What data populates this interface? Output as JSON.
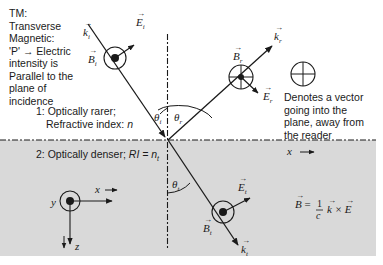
{
  "tm_note": {
    "lines": [
      "TM:",
      "Transverse",
      "Magnetic:",
      "'P' → Electric",
      "intensity is",
      "Parallel to the",
      "plane of",
      "incidence"
    ]
  },
  "medium_1": {
    "line1": "1: Optically rarer;",
    "line2_prefix": "Refractive index: ",
    "line2_symbol": "n"
  },
  "medium_2": {
    "prefix": "2: Optically denser; ",
    "symbol": "RI = n",
    "subscript": "t"
  },
  "into_plane_note": {
    "lines": [
      "Denotes a vector",
      "going into the",
      "plane, away from",
      "the reader"
    ]
  },
  "vectors": {
    "k_i": {
      "base": "k",
      "sub": "i"
    },
    "E_i": {
      "base": "E",
      "sub": "i"
    },
    "B_i": {
      "base": "B",
      "sub": "i"
    },
    "k_r": {
      "base": "k",
      "sub": "r"
    },
    "E_r": {
      "base": "E",
      "sub": "r"
    },
    "B_r": {
      "base": "B",
      "sub": "r"
    },
    "k_t": {
      "base": "k",
      "sub": "t"
    },
    "E_t": {
      "base": "E",
      "sub": "t"
    },
    "B_t": {
      "base": "B",
      "sub": "t"
    }
  },
  "angles": {
    "theta_i": {
      "base": "θ",
      "sub": "i"
    },
    "theta_r": {
      "base": "θ",
      "sub": "r"
    },
    "theta_t": {
      "base": "θ",
      "sub": "t"
    }
  },
  "axes": {
    "x": "x",
    "y": "y",
    "z": "z",
    "interface_x": "x"
  },
  "formula": {
    "lhs": "B",
    "equals": "=",
    "num": "1",
    "den": "c",
    "rhs": "k × E"
  },
  "colors": {
    "line": "#1a1a1a",
    "denser_medium": "#d9d9d9",
    "background": "#ffffff"
  }
}
